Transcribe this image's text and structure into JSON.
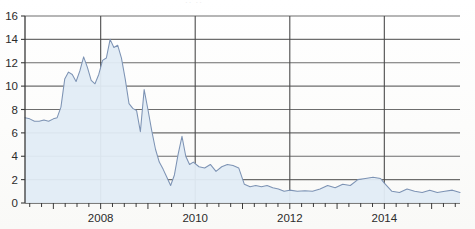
{
  "chart_data": {
    "type": "area",
    "title": "",
    "subtitle": "",
    "xlabel": "",
    "ylabel": "",
    "ylim": [
      0,
      16
    ],
    "ytick_step": 2,
    "yticks": [
      "0",
      "2",
      "4",
      "6",
      "8",
      "10",
      "12",
      "14",
      "16"
    ],
    "xticks_labeled": [
      "2008",
      "2010",
      "2012",
      "2014"
    ],
    "xlim": [
      2006.4,
      2015.6
    ],
    "grid": "horizontal-and-year-verticals",
    "legend": "none",
    "minor_tick_interval_years": 0.25,
    "series": [
      {
        "name": "series-1",
        "x": [
          2006.4,
          2006.5,
          2006.6,
          2006.7,
          2006.8,
          2006.9,
          2007.0,
          2007.08,
          2007.16,
          2007.24,
          2007.32,
          2007.4,
          2007.48,
          2007.56,
          2007.64,
          2007.72,
          2007.8,
          2007.88,
          2007.96,
          2008.04,
          2008.12,
          2008.2,
          2008.28,
          2008.36,
          2008.44,
          2008.52,
          2008.6,
          2008.68,
          2008.76,
          2008.84,
          2008.92,
          2009.0,
          2009.08,
          2009.16,
          2009.24,
          2009.32,
          2009.4,
          2009.48,
          2009.56,
          2009.64,
          2009.72,
          2009.8,
          2009.88,
          2009.96,
          2010.08,
          2010.2,
          2010.32,
          2010.44,
          2010.56,
          2010.68,
          2010.8,
          2010.92,
          2011.04,
          2011.16,
          2011.28,
          2011.4,
          2011.52,
          2011.64,
          2011.76,
          2011.88,
          2012.0,
          2012.16,
          2012.32,
          2012.48,
          2012.64,
          2012.8,
          2012.96,
          2013.12,
          2013.28,
          2013.44,
          2013.6,
          2013.76,
          2013.92,
          2014.0,
          2014.16,
          2014.32,
          2014.48,
          2014.64,
          2014.8,
          2014.96,
          2015.12,
          2015.28,
          2015.44,
          2015.6
        ],
        "values": [
          7.3,
          7.2,
          7.0,
          7.0,
          7.1,
          7.0,
          7.2,
          7.3,
          8.2,
          10.6,
          11.2,
          11.0,
          10.4,
          11.3,
          12.5,
          11.6,
          10.5,
          10.2,
          11.0,
          12.2,
          12.4,
          14.0,
          13.3,
          13.5,
          12.4,
          10.6,
          8.5,
          8.1,
          7.9,
          6.1,
          9.7,
          8.0,
          6.2,
          4.6,
          3.5,
          2.9,
          2.2,
          1.5,
          2.4,
          4.2,
          5.7,
          4.0,
          3.3,
          3.5,
          3.1,
          3.0,
          3.3,
          2.7,
          3.1,
          3.3,
          3.2,
          3.0,
          1.6,
          1.4,
          1.5,
          1.4,
          1.5,
          1.3,
          1.2,
          1.0,
          1.1,
          1.0,
          1.05,
          1.0,
          1.2,
          1.5,
          1.3,
          1.6,
          1.5,
          2.0,
          2.1,
          2.2,
          2.1,
          1.7,
          1.0,
          0.9,
          1.2,
          1.0,
          0.9,
          1.1,
          0.9,
          1.0,
          1.1,
          0.9
        ]
      }
    ],
    "colors": {
      "line": "#7d93b4",
      "fill": "#e2ecf5",
      "grid": "#4a4a4a",
      "axis": "#3a3a3a",
      "text": "#2b2b2b"
    }
  },
  "axis": {
    "y_labels": [
      "16",
      "14",
      "12",
      "10",
      "8",
      "6",
      "4",
      "2",
      "0"
    ],
    "x_labels": [
      "2008",
      "2010",
      "2012",
      "2014"
    ]
  },
  "artifacts": {
    "top_ghost_text": "··  ··"
  }
}
